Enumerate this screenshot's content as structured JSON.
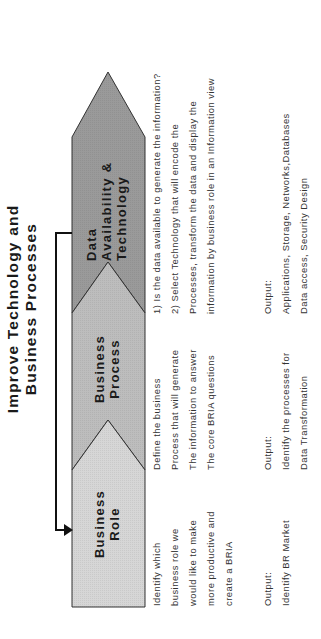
{
  "title": {
    "line1": "Improve Technology and",
    "line2": "Business Processes"
  },
  "colors": {
    "business_role": "#d6d6d6",
    "business_process": "#bdbdbd",
    "data_technology": "#9a9a9a",
    "outline": "#333333"
  },
  "stages": [
    {
      "label_lines": [
        "Business",
        "Role"
      ],
      "description": [
        "Identify which",
        "business role we",
        "would like to make",
        "more productive and",
        "create a BRIA"
      ],
      "output_label": "Output:",
      "output": [
        "Identify BR Market"
      ]
    },
    {
      "label_lines": [
        "Business",
        "Process"
      ],
      "description": [
        "Define the business",
        "Process that will generate",
        "The information to answer",
        "The core BRIA questions"
      ],
      "output_label": "Output:",
      "output": [
        "Identify the processes for",
        "Data Transformation"
      ]
    },
    {
      "label_lines": [
        "Data",
        "Availability &",
        "Technology"
      ],
      "description": [
        "1) Is the data available to generate the information?",
        "2) Select Technology that will encode the",
        "Processes, transform the data and display the",
        "information by business role in an Information view"
      ],
      "output_label": "Output:",
      "output": [
        "Applications, Storage, Networks,Databases",
        "Data access, Security Design"
      ]
    }
  ]
}
